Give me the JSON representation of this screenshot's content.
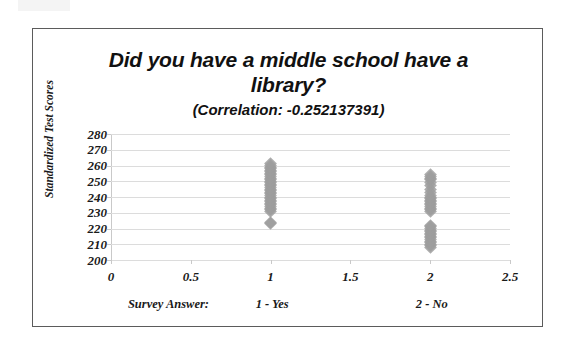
{
  "chart_data": {
    "type": "scatter",
    "title": "Did you have a middle school have a library?",
    "subtitle": "(Correlation: -0.252137391)",
    "xlabel": "",
    "ylabel": "Standardized Test Scores",
    "xlim": [
      0,
      2.5
    ],
    "ylim": [
      200,
      280
    ],
    "grid": true,
    "legend": false,
    "xticks": [
      "0",
      "0.5",
      "1",
      "1.5",
      "2",
      "2.5"
    ],
    "xtick_values": [
      0,
      0.5,
      1,
      1.5,
      2,
      2.5
    ],
    "yticks": [
      "200",
      "210",
      "220",
      "230",
      "240",
      "250",
      "260",
      "270",
      "280"
    ],
    "ytick_values": [
      200,
      210,
      220,
      230,
      240,
      250,
      260,
      270,
      280
    ],
    "marker": "diamond",
    "marker_color": "#9d9d9d",
    "series": [
      {
        "name": "1 - Yes",
        "x": 1,
        "values": [
          223,
          224,
          231,
          232,
          233,
          234,
          235,
          236,
          237,
          238,
          239,
          240,
          241,
          242,
          243,
          244,
          245,
          246,
          247,
          248,
          249,
          250,
          251,
          252,
          253,
          254,
          255,
          256,
          257,
          258,
          259,
          260,
          261
        ]
      },
      {
        "name": "2 - No",
        "x": 2,
        "values": [
          208,
          209,
          210,
          211,
          212,
          213,
          214,
          215,
          216,
          217,
          218,
          219,
          220,
          221,
          222,
          231,
          232,
          233,
          234,
          235,
          236,
          237,
          238,
          239,
          240,
          241,
          243,
          245,
          247,
          249,
          251,
          252,
          253,
          254
        ]
      }
    ],
    "axis_captions": [
      {
        "label": "Survey Answer:",
        "x": 0.36
      },
      {
        "label": "1 - Yes",
        "x": 1.01
      },
      {
        "label": "2 - No",
        "x": 2.01
      }
    ]
  },
  "colors": {
    "marker": "#9d9d9d",
    "gridline": "#dcdcdc",
    "border": "#5b5b5b",
    "text": "#1a1a1a"
  }
}
